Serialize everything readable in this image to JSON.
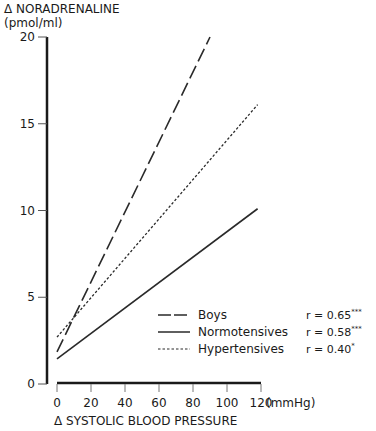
{
  "chart_data": {
    "type": "line",
    "title": "",
    "ylabel": "Δ NORADRENALINE",
    "ylabel_unit": "(pmol/ml)",
    "xlabel": "Δ SYSTOLIC BLOOD PRESSURE",
    "xlabel_unit": "(mmHg)",
    "xlim": [
      0,
      120
    ],
    "ylim": [
      0,
      20
    ],
    "x_ticks": [
      0,
      20,
      40,
      60,
      80,
      100,
      120
    ],
    "y_ticks": [
      0,
      5,
      10,
      15,
      20
    ],
    "grid": false,
    "legend_position": "lower right",
    "series": [
      {
        "name": "Boys",
        "style": "dashed",
        "r": "r = 0.65",
        "significance": "***",
        "x": [
          0,
          90
        ],
        "y": [
          1.85,
          20
        ]
      },
      {
        "name": "Normotensives",
        "style": "solid",
        "r": "r = 0.58",
        "significance": "***",
        "x": [
          0,
          118
        ],
        "y": [
          1.45,
          10.1
        ]
      },
      {
        "name": "Hypertensives",
        "style": "dotted",
        "r": "r = 0.40",
        "significance": "*",
        "x": [
          0,
          118
        ],
        "y": [
          2.7,
          16.1
        ]
      }
    ]
  }
}
